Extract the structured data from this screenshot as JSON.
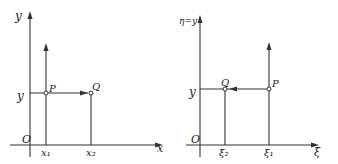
{
  "left_diagram": {
    "y_axis_label": "y",
    "x_axis_label": "x",
    "origin_label": "O",
    "y_value_label": "y",
    "x1_label": "x₁",
    "x2_label": "x₂",
    "point_p_label": "P",
    "point_q_label": "Q",
    "arrow_direction": "P to Q (rightward)"
  },
  "right_diagram": {
    "y_axis_label": "η=y",
    "x_axis_label": "ξ",
    "origin_label": "O",
    "y_value_label": "y",
    "xi2_label": "ξ₂",
    "xi1_label": "ξ₁",
    "point_p_label": "P",
    "point_q_label": "Q",
    "arrow_direction": "P to Q (leftward)"
  },
  "colors": {
    "line": "#333333",
    "background": "#ffffff"
  }
}
